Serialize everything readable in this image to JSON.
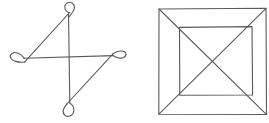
{
  "image": {
    "width": 269,
    "height": 123,
    "background_color": "#ffffff",
    "stroke_color": "#5a5a5a",
    "description": "Two black-and-white line drawings side by side on a white background"
  },
  "figures": [
    {
      "id": "left-figure",
      "name": "pinwheel-loop-figure",
      "label": "Four-armed pinwheel of crossing lines with small teardrop loops at each end",
      "stroke_color": "#5a5a5a",
      "bounds": {
        "x": 10,
        "y": 2,
        "width": 115,
        "height": 118
      },
      "elements": [
        {
          "type": "line",
          "name": "vertical-stem",
          "x1": 68,
          "y1": 14,
          "x2": 70,
          "y2": 104
        },
        {
          "type": "line",
          "name": "horizontal-stem",
          "x1": 24,
          "y1": 58,
          "x2": 114,
          "y2": 56
        },
        {
          "type": "line",
          "name": "diagonal-upper-left",
          "x1": 29,
          "y1": 62,
          "x2": 70,
          "y2": 12
        },
        {
          "type": "line",
          "name": "diagonal-lower-right",
          "x1": 67,
          "y1": 104,
          "x2": 112,
          "y2": 54
        },
        {
          "type": "loop",
          "name": "loop-top",
          "cx": 70,
          "cy": 9,
          "rx": 5,
          "ry": 8,
          "rotation": 0
        },
        {
          "type": "loop",
          "name": "loop-left",
          "cx": 18,
          "cy": 59,
          "rx": 8,
          "ry": 5,
          "rotation": 0
        },
        {
          "type": "loop",
          "name": "loop-right",
          "cx": 118,
          "cy": 54,
          "rx": 8,
          "ry": 5,
          "rotation": 0
        },
        {
          "type": "loop",
          "name": "loop-bottom",
          "cx": 67,
          "cy": 110,
          "rx": 5,
          "ry": 8,
          "rotation": 0
        }
      ]
    },
    {
      "id": "right-figure",
      "name": "nested-squares-figure",
      "label": "Outer square containing an inner square, with diagonals joining the corners",
      "stroke_color": "#5a5a5a",
      "outer_square": {
        "x": 158,
        "y": 8,
        "width": 108,
        "height": 107
      },
      "inner_square": {
        "x": 179,
        "y": 27,
        "width": 73,
        "height": 68
      },
      "diagonals": [
        {
          "name": "diagonal-top-left-to-bottom-right",
          "x1": 159,
          "y1": 9,
          "x2": 265,
          "y2": 114
        },
        {
          "name": "diagonal-top-right-to-bottom-left",
          "x1": 265,
          "y1": 9,
          "x2": 159,
          "y2": 114
        }
      ]
    }
  ]
}
